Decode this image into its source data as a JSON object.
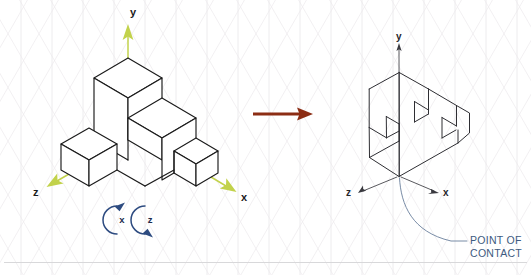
{
  "diagram": {
    "background_grid": "isometric-triangular-grid",
    "colors": {
      "axis_green": "#c2d24b",
      "rotation_blue": "#2d4b80",
      "transform_arrow_red": "#8c2d14",
      "callout_blue": "#3d5a80",
      "edge_black": "#1b1b1b",
      "sketch_gray": "#2e2e33",
      "grid_gray": "#eceaec",
      "divider_gray": "#d8d8da"
    }
  },
  "left_panel": {
    "name": "isometric-staircase-block",
    "description": "Clean isometric line drawing of a stepped block assembly",
    "axes": [
      {
        "id": "y",
        "label": "y",
        "direction": "up"
      },
      {
        "id": "z",
        "label": "z",
        "direction": "down-left"
      },
      {
        "id": "x",
        "label": "x",
        "direction": "down-right"
      }
    ],
    "rotation_hints": [
      {
        "id": "rot-x",
        "label": "x",
        "spin": "counter-clockwise"
      },
      {
        "id": "rot-z",
        "label": "z",
        "spin": "clockwise"
      }
    ]
  },
  "transform_arrow": {
    "name": "transform-arrow",
    "label": "",
    "direction": "right"
  },
  "right_panel": {
    "name": "rotated-sketch-block",
    "description": "Hand sketched rotated view of the same stepped block",
    "axes": [
      {
        "id": "y",
        "label": "y",
        "direction": "up"
      },
      {
        "id": "z",
        "label": "z",
        "direction": "down-left"
      },
      {
        "id": "x",
        "label": "x",
        "direction": "down-right"
      }
    ],
    "callout": {
      "line1": "POINT OF",
      "line2": "CONTACT"
    }
  }
}
